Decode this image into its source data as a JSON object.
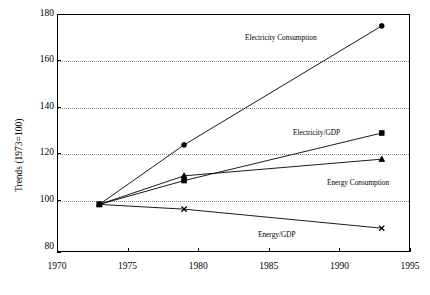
{
  "chart_data": {
    "type": "line",
    "title": "",
    "xlabel": "",
    "ylabel": "Trends (1973=100)",
    "xlim": [
      1970,
      1995
    ],
    "ylim": [
      80,
      180
    ],
    "x": [
      1973,
      1979,
      1993
    ],
    "xticks": [
      "1970",
      "1975",
      "1980",
      "1985",
      "1990",
      "1995"
    ],
    "yticks": [
      "80",
      "100",
      "120",
      "140",
      "160",
      "180"
    ],
    "grid": "horizontal-dotted",
    "legend": "inline-annotations",
    "series": [
      {
        "name": "Electricity Consumption",
        "marker": "circle",
        "values": [
          100,
          125,
          175
        ]
      },
      {
        "name": "Electricity/GDP",
        "marker": "square",
        "values": [
          100,
          110,
          130
        ]
      },
      {
        "name": "Energy Consumption",
        "marker": "triangle",
        "values": [
          100,
          112,
          119
        ]
      },
      {
        "name": "Energy/GDP",
        "marker": "cross",
        "values": [
          100,
          98,
          90
        ]
      }
    ]
  },
  "annotations": {
    "electricity_consumption": "Electricity Consumption",
    "electricity_gdp": "Electricity/GDP",
    "energy_consumption": "Energy Consumption",
    "energy_gdp": "Energy/GDP"
  },
  "axis": {
    "y_title": "Trends (1973=100)"
  },
  "caption": ""
}
